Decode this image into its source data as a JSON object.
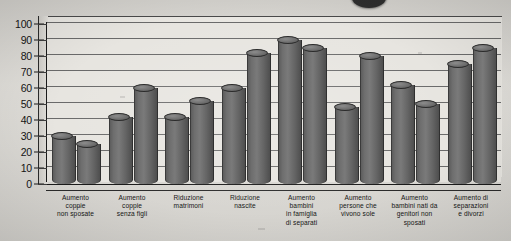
{
  "chart_data": {
    "type": "bar",
    "title": "",
    "subtitle": "",
    "xlabel": "",
    "ylabel": "",
    "ylim": [
      0,
      100
    ],
    "grid": true,
    "legend": "none",
    "style": "3d-cylinder",
    "y_ticks": [
      0,
      10,
      20,
      30,
      40,
      50,
      60,
      70,
      80,
      90,
      100
    ],
    "categories": [
      "Aumento coppie non sposate",
      "Aumento coppie senza figli",
      "Riduzione matrimoni",
      "Riduzione nascite",
      "Aumento bambini in famiglia di separati",
      "Aumento persone che vivono sole",
      "Aumento bambini nati da genitori non sposati",
      "Aumento di separazioni e divorzi"
    ],
    "category_lines": [
      [
        "Aumento",
        "coppie",
        "non sposate"
      ],
      [
        "Aumento",
        "coppie",
        "senza figli"
      ],
      [
        "Riduzione",
        "matrimoni"
      ],
      [
        "Riduzione",
        "nascite"
      ],
      [
        "Aumento",
        "bambini",
        "in famiglia",
        "di separati"
      ],
      [
        "Aumento",
        "persone che",
        "vivono sole"
      ],
      [
        "Aumento",
        "bambini nati da",
        "genitori non",
        "sposati"
      ],
      [
        "Aumento di",
        "separazioni",
        "e divorzi"
      ]
    ],
    "series": [
      {
        "name": "Serie 1",
        "values": [
          30,
          42,
          42,
          60,
          90,
          48,
          62,
          75
        ]
      },
      {
        "name": "Serie 2",
        "values": [
          25,
          60,
          52,
          82,
          85,
          80,
          50,
          85
        ]
      }
    ],
    "bar_values_flat": [
      30,
      25,
      42,
      60,
      42,
      52,
      60,
      82,
      90,
      85,
      48,
      80,
      62,
      50,
      75,
      85
    ],
    "colors": {
      "bar_fill": "#6e6e6e",
      "bar_edge": "#2f2f2f",
      "plot_background": "#e7e5e0",
      "page_background": "#dedcd7",
      "gridline": "#6a6a6a",
      "axis": "#1a1a1a",
      "text": "#151515"
    }
  }
}
